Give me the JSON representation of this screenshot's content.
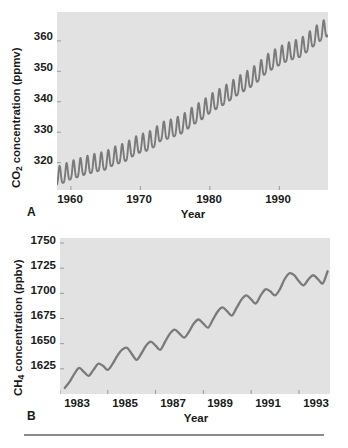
{
  "figure": {
    "panels": [
      {
        "letter": "A",
        "y_label_prefix": "CO",
        "y_label_sub": "2",
        "y_label_suffix": " concentration (ppmv)",
        "x_label": "Year",
        "y_ticks": [
          "320",
          "330",
          "340",
          "350",
          "360"
        ],
        "x_ticks": [
          "1960",
          "1970",
          "1980",
          "1990"
        ]
      },
      {
        "letter": "B",
        "y_label_prefix": "CH",
        "y_label_sub": "4",
        "y_label_suffix": " concentration (ppbv)",
        "x_label": "Year",
        "y_ticks": [
          "1625",
          "1650",
          "1675",
          "1700",
          "1725",
          "1750"
        ],
        "x_ticks": [
          "1983",
          "1985",
          "1987",
          "1989",
          "1991",
          "1993"
        ]
      }
    ]
  },
  "colors": {
    "plot_background": "#e2e2e2",
    "data_line": "#7a7a7a",
    "text": "#1a1a1a",
    "rule": "#8a8a8a",
    "page_background": "#ffffff"
  },
  "chart_data": [
    {
      "type": "line",
      "title": "",
      "panel": "A",
      "xlabel": "Year",
      "ylabel": "CO2 concentration (ppmv)",
      "xlim": [
        1958.0,
        1997.0
      ],
      "ylim": [
        311.0,
        369.5
      ],
      "xticks": [
        1960,
        1970,
        1980,
        1990
      ],
      "yticks": [
        320,
        330,
        340,
        350,
        360
      ],
      "grid": false,
      "legend": "none",
      "series_description": "Mauna Loa Keeling Curve: monthly mean atmospheric CO2 with a strong annual sawtooth seasonal cycle of about 6 ppmv peak-to-trough superimposed on a steadily accelerating rise.",
      "annual_cycle_amplitude_ppmv": 6.0,
      "x": [
        1958.0,
        1959.0,
        1960.0,
        1961.0,
        1962.0,
        1963.0,
        1964.0,
        1965.0,
        1966.0,
        1967.0,
        1968.0,
        1969.0,
        1970.0,
        1971.0,
        1972.0,
        1973.0,
        1974.0,
        1975.0,
        1976.0,
        1977.0,
        1978.0,
        1979.0,
        1980.0,
        1981.0,
        1982.0,
        1983.0,
        1984.0,
        1985.0,
        1986.0,
        1987.0,
        1988.0,
        1989.0,
        1990.0,
        1991.0,
        1992.0,
        1993.0,
        1994.0,
        1995.0,
        1996.0,
        1997.0
      ],
      "annual_mean": [
        315.0,
        315.8,
        316.9,
        317.6,
        318.4,
        319.0,
        319.6,
        320.0,
        321.4,
        322.2,
        323.0,
        324.6,
        325.7,
        326.3,
        327.5,
        329.7,
        330.2,
        331.1,
        332.0,
        333.8,
        335.4,
        336.8,
        338.7,
        340.1,
        341.4,
        343.0,
        344.6,
        346.0,
        347.4,
        349.2,
        351.6,
        353.1,
        354.4,
        355.6,
        356.4,
        357.1,
        358.8,
        360.8,
        362.6,
        364.0
      ],
      "seasonal_max": [
        318.0,
        318.8,
        319.9,
        320.6,
        321.4,
        322.0,
        322.6,
        323.0,
        324.4,
        325.2,
        326.0,
        327.6,
        328.7,
        329.3,
        330.5,
        332.7,
        333.2,
        334.1,
        335.0,
        336.8,
        338.4,
        339.8,
        341.7,
        343.1,
        344.4,
        346.0,
        347.6,
        349.0,
        350.4,
        352.2,
        354.6,
        356.1,
        357.4,
        358.6,
        359.4,
        360.1,
        361.8,
        363.8,
        365.6,
        367.0
      ],
      "seasonal_min": [
        312.0,
        312.8,
        313.9,
        314.6,
        315.4,
        316.0,
        316.6,
        317.0,
        318.4,
        319.2,
        320.0,
        321.6,
        322.7,
        323.3,
        324.5,
        326.7,
        327.2,
        328.1,
        329.0,
        330.8,
        332.4,
        333.8,
        335.7,
        337.1,
        338.4,
        340.0,
        341.6,
        343.0,
        344.4,
        346.2,
        348.6,
        350.1,
        351.4,
        352.6,
        353.4,
        354.1,
        355.8,
        357.8,
        359.6,
        361.0
      ]
    },
    {
      "type": "line",
      "title": "",
      "panel": "B",
      "xlabel": "Year",
      "ylabel": "CH4 concentration (ppbv)",
      "xlim": [
        1983.0,
        1994.3
      ],
      "ylim": [
        1600.0,
        1755.0
      ],
      "xticks": [
        1983,
        1985,
        1987,
        1989,
        1991,
        1993
      ],
      "yticks": [
        1625,
        1650,
        1675,
        1700,
        1725,
        1750
      ],
      "grid": false,
      "legend": "none",
      "series_description": "Globally averaged monthly atmospheric CH4 showing an irregular wavy seasonal cycle of roughly 10-15 ppbv on a strong upward trend that flattens after 1992.",
      "x": [
        1983.2,
        1983.4,
        1983.6,
        1983.8,
        1984.0,
        1984.2,
        1984.4,
        1984.6,
        1984.8,
        1985.0,
        1985.2,
        1985.4,
        1985.6,
        1985.8,
        1986.0,
        1986.2,
        1986.4,
        1986.6,
        1986.8,
        1987.0,
        1987.2,
        1987.4,
        1987.6,
        1987.8,
        1988.0,
        1988.2,
        1988.4,
        1988.6,
        1988.8,
        1989.0,
        1989.2,
        1989.4,
        1989.6,
        1989.8,
        1990.0,
        1990.2,
        1990.4,
        1990.6,
        1990.8,
        1991.0,
        1991.2,
        1991.4,
        1991.6,
        1991.8,
        1992.0,
        1992.2,
        1992.4,
        1992.6,
        1992.8,
        1993.0,
        1993.2,
        1993.4,
        1993.6,
        1993.8,
        1994.0,
        1994.2
      ],
      "values": [
        1606,
        1612,
        1620,
        1626,
        1622,
        1618,
        1624,
        1630,
        1628,
        1624,
        1630,
        1638,
        1644,
        1646,
        1640,
        1634,
        1640,
        1648,
        1652,
        1648,
        1644,
        1652,
        1660,
        1664,
        1660,
        1656,
        1662,
        1670,
        1674,
        1670,
        1666,
        1674,
        1682,
        1686,
        1682,
        1678,
        1686,
        1694,
        1698,
        1694,
        1690,
        1698,
        1704,
        1702,
        1698,
        1704,
        1714,
        1720,
        1718,
        1712,
        1708,
        1714,
        1718,
        1714,
        1710,
        1722
      ]
    }
  ]
}
